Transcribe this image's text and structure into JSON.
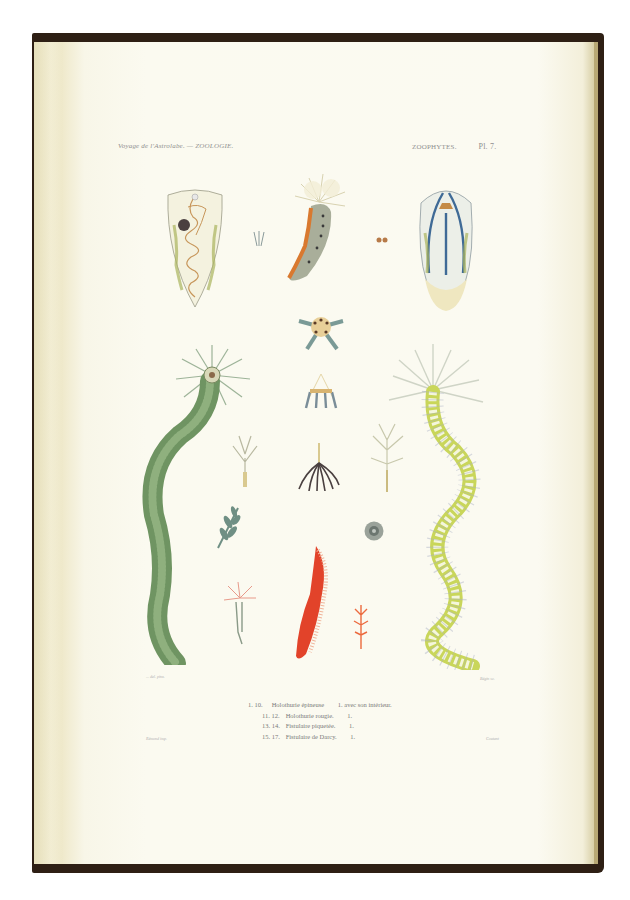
{
  "plate": {
    "header_left": "Voyage de l'Astrolabe. — ZOOLOGIE.",
    "header_right_section": "ZOOPHYTES.",
    "header_right_plate": "Pl. 7.",
    "credit_left_top": "... del. pinx.",
    "credit_right_top": "Bégin sc.",
    "credit_left_bottom": "Rémond imp.",
    "credit_right_bottom": "Coutant"
  },
  "legend": [
    {
      "nums": "1. 10.",
      "text": "Holothurie épineuse",
      "scale": "1. avec son intérieur."
    },
    {
      "nums": "11. 12.",
      "text": "Holothurie rougie.",
      "scale": "1."
    },
    {
      "nums": "13. 14.",
      "text": "Fistulaire piquetée.",
      "scale": "1."
    },
    {
      "nums": "15. 17.",
      "text": "Fistulaire de Darcy.",
      "scale": "1."
    }
  ],
  "figures": [
    {
      "id": "fig-1",
      "label": "1"
    },
    {
      "id": "fig-2",
      "label": "2"
    },
    {
      "id": "fig-3",
      "label": "3"
    },
    {
      "id": "fig-4",
      "label": "4"
    },
    {
      "id": "fig-5",
      "label": "5"
    },
    {
      "id": "fig-6",
      "label": "6"
    },
    {
      "id": "fig-7",
      "label": "7"
    },
    {
      "id": "fig-11",
      "label": "11"
    },
    {
      "id": "fig-13",
      "label": "13"
    },
    {
      "id": "fig-14",
      "label": "14"
    },
    {
      "id": "fig-15",
      "label": "15"
    },
    {
      "id": "fig-16",
      "label": "16"
    },
    {
      "id": "fig-17",
      "label": "17"
    }
  ],
  "colors": {
    "cover": "#2e1f14",
    "paper": "#fbfaf0",
    "green_worm": "#6f9462",
    "yellow_worm": "#c9d65a",
    "red_specimen": "#e2432a",
    "blue_stripes": "#3f6a96",
    "orange_stripe": "#d9792f"
  }
}
